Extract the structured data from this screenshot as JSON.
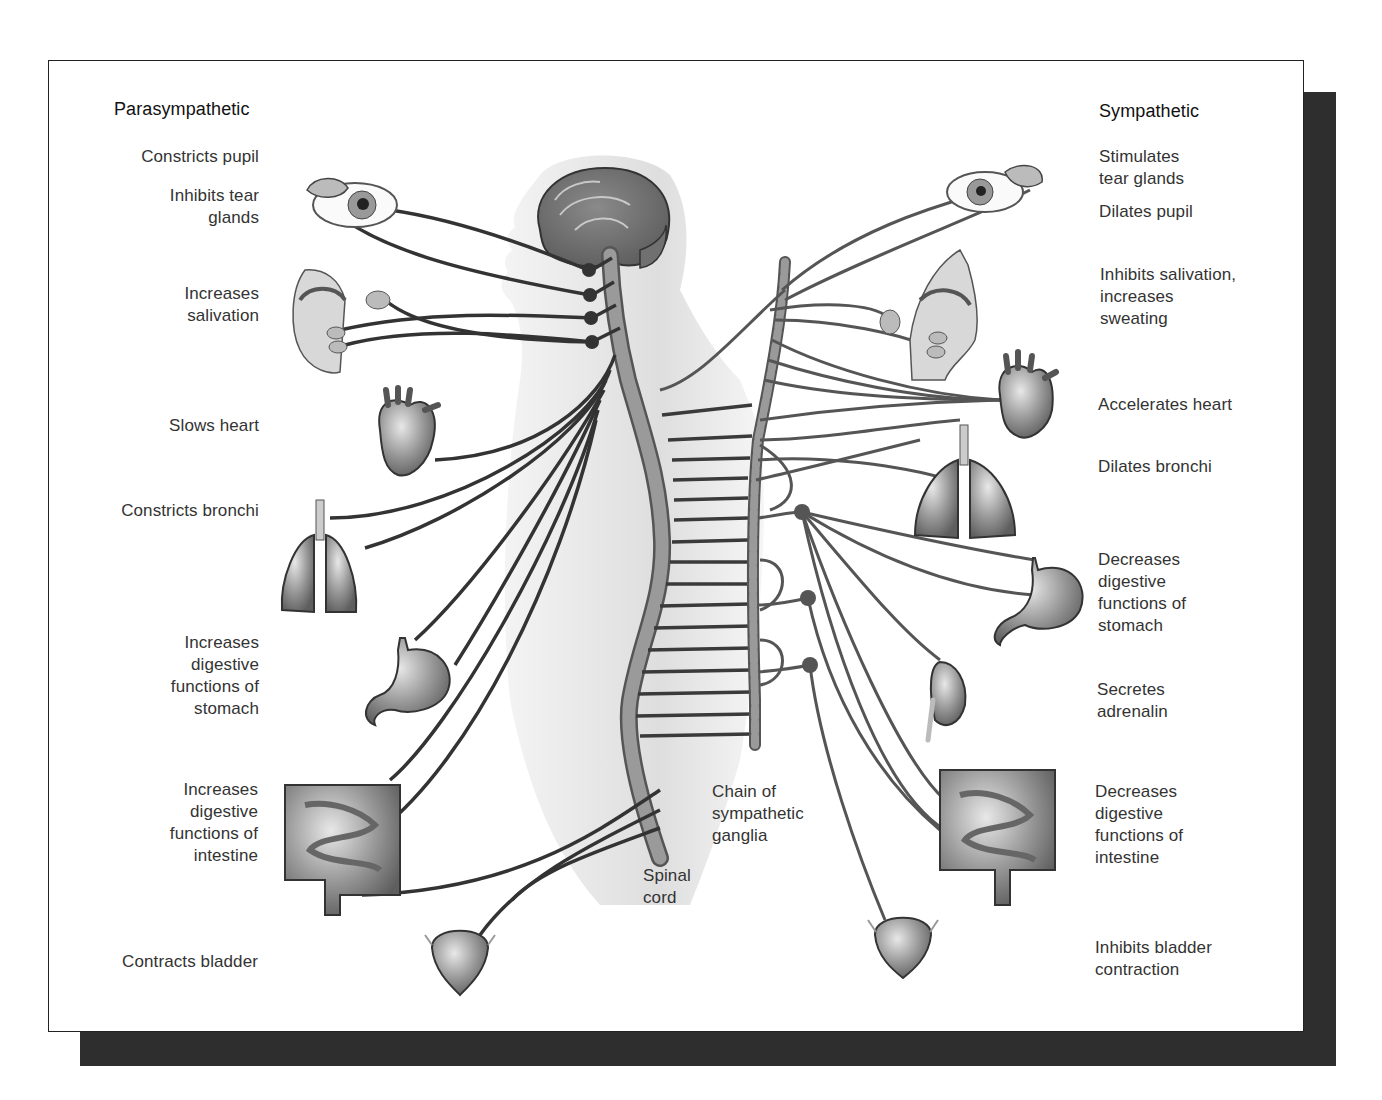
{
  "parasympathetic": {
    "heading": "Parasympathetic",
    "labels": [
      {
        "id": "pupil",
        "text": "Constricts pupil"
      },
      {
        "id": "tear",
        "text": "Inhibits tear\nglands"
      },
      {
        "id": "saliva",
        "text": "Increases\nsalivation"
      },
      {
        "id": "heart",
        "text": "Slows heart"
      },
      {
        "id": "bronchi",
        "text": "Constricts bronchi"
      },
      {
        "id": "stomach",
        "text": "Increases\ndigestive\nfunctions of\nstomach"
      },
      {
        "id": "intestine",
        "text": "Increases\ndigestive\nfunctions of\nintestine"
      },
      {
        "id": "bladder",
        "text": "Contracts bladder"
      }
    ]
  },
  "sympathetic": {
    "heading": "Sympathetic",
    "labels": [
      {
        "id": "tear",
        "text": "Stimulates\ntear glands"
      },
      {
        "id": "pupil",
        "text": "Dilates pupil"
      },
      {
        "id": "saliva",
        "text": "Inhibits salivation,\nincreases\nsweating"
      },
      {
        "id": "heart",
        "text": "Accelerates heart"
      },
      {
        "id": "bronchi",
        "text": "Dilates bronchi"
      },
      {
        "id": "stomach",
        "text": "Decreases\ndigestive\nfunctions of\nstomach"
      },
      {
        "id": "adrenal",
        "text": "Secretes\nadrenalin"
      },
      {
        "id": "intestine",
        "text": "Decreases\ndigestive\nfunctions of\nintestine"
      },
      {
        "id": "bladder",
        "text": "Inhibits bladder\ncontraction"
      }
    ]
  },
  "center": {
    "spinal_cord": "Spinal\ncord",
    "ganglia_chain": "Chain of\nsympathetic\nganglia"
  },
  "colors": {
    "nerve": "#3a3a3a",
    "organ": "#8a8a8a",
    "body_silhouette": "#e4e4e4",
    "shadow": "#2e2e2e"
  }
}
